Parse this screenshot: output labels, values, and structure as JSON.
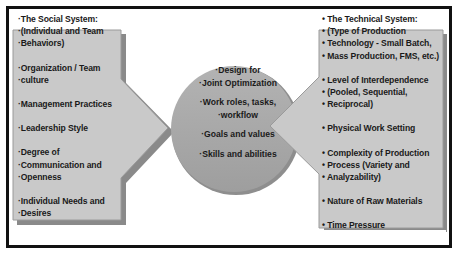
{
  "diagram": {
    "colors": {
      "border": "#111111",
      "panel_fill": "#c8c8c8",
      "circle_fill": "#a9a9a9",
      "text": "#1a1a1a"
    },
    "left_panel": {
      "title": "·The Social System:",
      "lines": [
        "·(Individual and Team",
        "·Behaviors)",
        "",
        "·Organization / Team",
        "·culture",
        "",
        "·Management Practices",
        "",
        "·Leadership Style",
        "",
        "·Degree of",
        "·Communication and",
        "·Openness",
        "",
        "·Individual Needs and",
        "·Desires"
      ]
    },
    "center_circle": {
      "groups": [
        [
          "·Design for",
          "·Joint Optimization"
        ],
        [
          "·Work roles, tasks,",
          "·workflow"
        ],
        [
          "·Goals and values"
        ],
        [
          "·Skills and abilities"
        ]
      ]
    },
    "right_panel": {
      "title": "•  The Technical System:",
      "lines": [
        "•  (Type of Production",
        "•  Technology - Small Batch,",
        "•  Mass Production, FMS, etc.)",
        "",
        "•  Level of Interdependence",
        "•  (Pooled, Sequential,",
        "•  Reciprocal)",
        "",
        "•  Physical Work Setting",
        "",
        "•  Complexity of Production",
        "•  Process (Variety and",
        "•  Analyzability)",
        "",
        "•  Nature of Raw Materials",
        "",
        "•  Time Pressure"
      ]
    }
  }
}
